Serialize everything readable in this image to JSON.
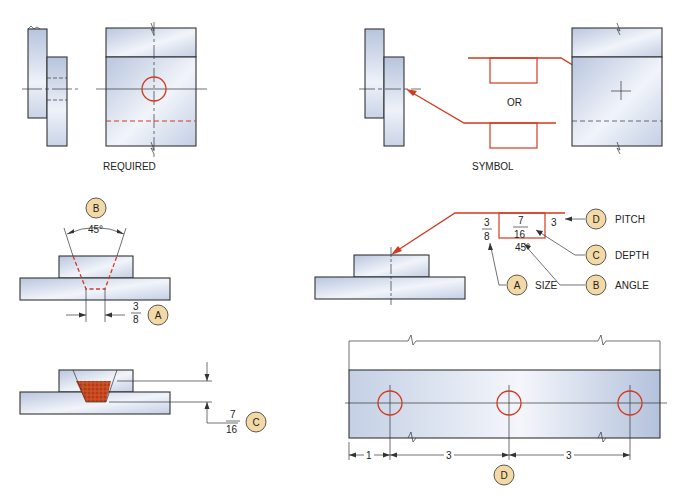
{
  "figure": {
    "colors": {
      "symbol_red": "#d23a1e",
      "callout_fill": "#f3d9a6",
      "part_fill_light": "#eef2f9",
      "part_fill_dark": "#b9c6de",
      "fill_material": "#c8491f",
      "line": "#333333"
    },
    "top_left": {
      "caption": "REQUIRED"
    },
    "top_right": {
      "caption": "SYMBOL",
      "or_label": "OR"
    },
    "middle_left": {
      "callout_b": "B",
      "angle_label": "45°",
      "size_num": "3",
      "size_den": "8",
      "callout_a": "A"
    },
    "middle_right": {
      "size_num": "3",
      "size_den": "8",
      "depth_num": "7",
      "depth_den": "16",
      "pitch_value": "3",
      "angle_value": "45°",
      "callouts": [
        {
          "letter": "D",
          "label": "PITCH"
        },
        {
          "letter": "C",
          "label": "DEPTH"
        },
        {
          "letter": "A",
          "label": "SIZE"
        },
        {
          "letter": "B",
          "label": "ANGLE"
        }
      ]
    },
    "bottom_left": {
      "depth_num": "7",
      "depth_den": "16",
      "callout_c": "C"
    },
    "bottom_right": {
      "dim_first": "1",
      "dim_second": "3",
      "dim_third": "3",
      "callout_d": "D"
    }
  }
}
